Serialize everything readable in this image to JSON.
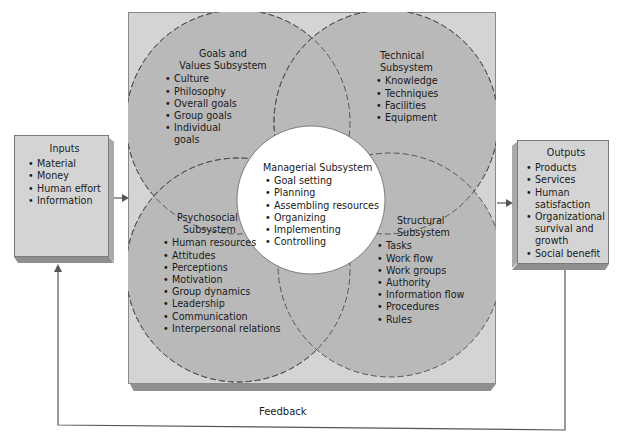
{
  "diagram": {
    "type": "systems-model",
    "colors": {
      "frame_fill": "#d4d4d4",
      "circle_fill": "#b9b9b9",
      "center_fill": "#ffffff",
      "line": "#555555"
    },
    "inputs": {
      "title": "Inputs",
      "items": [
        "Material",
        "Money",
        "Human effort",
        "Information"
      ]
    },
    "outputs": {
      "title": "Outputs",
      "items": [
        "Products",
        "Services",
        "Human satisfaction",
        "Organizational survival and growth",
        "Social benefit"
      ]
    },
    "subsystems": {
      "goals": {
        "title_line1": "Goals and",
        "title_line2": "Values Subsystem",
        "items": [
          "Culture",
          "Philosophy",
          "Overall goals",
          "Group goals",
          "Individual goals"
        ]
      },
      "technical": {
        "title_line1": "Technical",
        "title_line2": "Subsystem",
        "items": [
          "Knowledge",
          "Techniques",
          "Facilities",
          "Equipment"
        ]
      },
      "psychosocial": {
        "title_line1": "Psychosocial",
        "title_line2": "Subsystem",
        "items": [
          "Human resources",
          "Attitudes",
          "Perceptions",
          "Motivation",
          "Group dynamics",
          "Leadership",
          "Communication",
          "Interpersonal relations"
        ]
      },
      "structural": {
        "title_line1": "Structural",
        "title_line2": "Subsystem",
        "items": [
          "Tasks",
          "Work flow",
          "Work groups",
          "Authority",
          "Information flow",
          "Procedures",
          "Rules"
        ]
      },
      "managerial": {
        "title": "Managerial Subsystem",
        "items": [
          "Goal setting",
          "Planning",
          "Assembling resources",
          "Organizing",
          "Implementing",
          "Controlling"
        ]
      }
    },
    "feedback": {
      "label": "Feedback"
    }
  }
}
